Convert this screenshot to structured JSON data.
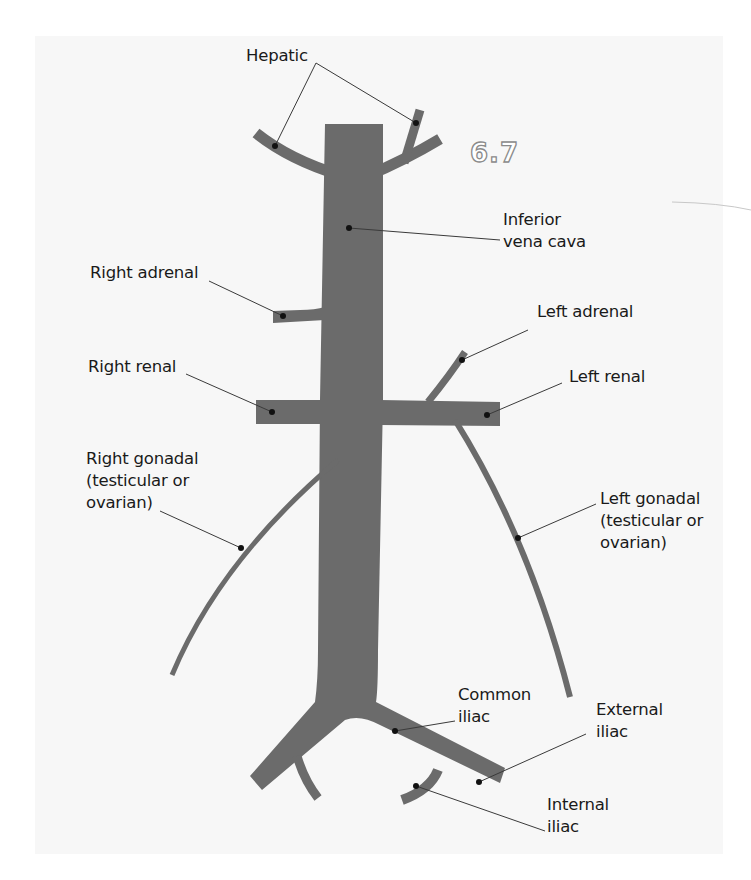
{
  "figure_number": "6.7",
  "colors": {
    "vessel": "#6b6b6b",
    "panel": "#f7f7f7",
    "text": "#1a1a1a",
    "leader": "#3a3a3a"
  },
  "labels": {
    "hepatic": [
      "Hepatic"
    ],
    "inferior_vena_cava": [
      "Inferior",
      "vena cava"
    ],
    "right_adrenal": [
      "Right adrenal"
    ],
    "left_adrenal": [
      "Left adrenal"
    ],
    "right_renal": [
      "Right renal"
    ],
    "left_renal": [
      "Left renal"
    ],
    "right_gonadal": [
      "Right gonadal",
      "(testicular or",
      "ovarian)"
    ],
    "left_gonadal": [
      "Left gonadal",
      "(testicular or",
      "ovarian)"
    ],
    "common_iliac": [
      "Common",
      "iliac"
    ],
    "external_iliac": [
      "External",
      "iliac"
    ],
    "internal_iliac": [
      "Internal",
      "iliac"
    ]
  }
}
